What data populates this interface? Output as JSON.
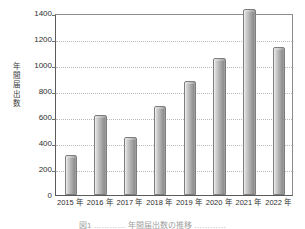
{
  "chart_data": {
    "type": "bar",
    "title": "",
    "xlabel": "",
    "ylabel": "年間届出数",
    "ylabel_chars": [
      "年",
      "間",
      "届",
      "出",
      "数"
    ],
    "categories": [
      "2015 年",
      "2016 年",
      "2017 年",
      "2018 年",
      "2019 年",
      "2020 年",
      "2021 年",
      "2022 年"
    ],
    "values": [
      305,
      615,
      445,
      685,
      875,
      1055,
      1430,
      1140
    ],
    "ylim": [
      0,
      1400
    ],
    "yticks": [
      0,
      200,
      400,
      600,
      800,
      1000,
      1200,
      1400
    ],
    "ytick_labels": [
      "0",
      "200",
      "400",
      "600",
      "800",
      "1000",
      "1200",
      "1400"
    ],
    "grid": "horizontal-dotted",
    "legend": "none",
    "bar_style": "cylinder-gradient-gray",
    "note": "2021 bar extends above the 1400 top frame line"
  },
  "figure": {
    "caption_truncated": "図1 ………… 年間届出数の推移 …………",
    "colors": {
      "bar_light": "#f1f1f1",
      "bar_mid": "#bdbdbd",
      "bar_dark": "#8e8e8e",
      "bar_edge": "#7e7e7e",
      "grid": "#b9b9b9",
      "axis": "#5a5a5a",
      "frame": "#8c8c8c",
      "text": "#2f2f2f",
      "background": "#ffffff"
    }
  }
}
